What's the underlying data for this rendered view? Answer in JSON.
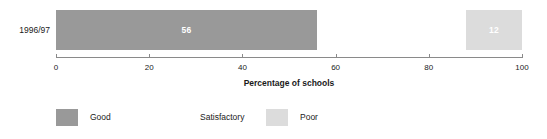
{
  "chart_data": {
    "type": "bar",
    "orientation": "horizontal",
    "stacked": true,
    "categories": [
      "1996/97"
    ],
    "series": [
      {
        "name": "Good",
        "values": [
          56
        ],
        "color": "#999999",
        "label_color": "#ffffff"
      },
      {
        "name": "Satisfactory",
        "values": [
          32
        ],
        "color": "#ffffff",
        "label_color": "#ffffff"
      },
      {
        "name": "Poor",
        "values": [
          12
        ],
        "color": "#dcdcdc",
        "label_color": "#ffffff"
      }
    ],
    "bar_labels": [
      "56",
      "",
      "12"
    ],
    "title": "",
    "xlabel": "Percentage of schools",
    "ylabel": "",
    "xlim": [
      0,
      100
    ],
    "xticks": [
      0,
      20,
      40,
      60,
      80,
      100
    ],
    "xtick_labels": [
      "0",
      "20",
      "40",
      "60",
      "80",
      "100"
    ],
    "grid": false,
    "legend_position": "bottom-left",
    "legend_entries": [
      "Good",
      "Satisfactory",
      "Poor"
    ]
  },
  "axis": {
    "title": "Percentage of schools",
    "ticks": [
      {
        "value": 0,
        "label": "0"
      },
      {
        "value": 20,
        "label": "20"
      },
      {
        "value": 40,
        "label": "40"
      },
      {
        "value": 60,
        "label": "60"
      },
      {
        "value": 80,
        "label": "80"
      },
      {
        "value": 100,
        "label": "100"
      }
    ],
    "line_color": "#8a8a8a"
  },
  "rows": [
    {
      "category": "1996/97",
      "segments": [
        {
          "name": "Good",
          "value": 56,
          "label": "56",
          "color": "#999999",
          "show_label": true
        },
        {
          "name": "Satisfactory",
          "value": 32,
          "label": "32",
          "color": "#ffffff",
          "show_label": false
        },
        {
          "name": "Poor",
          "value": 12,
          "label": "12",
          "color": "#dcdcdc",
          "show_label": true
        }
      ]
    }
  ],
  "legend": {
    "items": [
      {
        "label": "Good",
        "color": "#999999",
        "x": 0
      },
      {
        "label": "Satisfactory",
        "color": "#ffffff",
        "x": 110
      },
      {
        "label": "Poor",
        "color": "#dcdcdc",
        "x": 210
      }
    ]
  }
}
